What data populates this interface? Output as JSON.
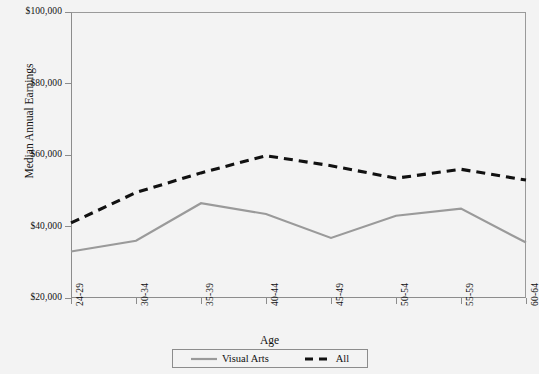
{
  "chart_data": {
    "type": "line",
    "title": "",
    "xlabel": "Age",
    "ylabel": "Median Annual Earnings",
    "categories": [
      "24-29",
      "30-34",
      "35-39",
      "40-44",
      "45-49",
      "50-54",
      "55-59",
      "60-64"
    ],
    "ylim": [
      20000,
      100000
    ],
    "yticks": [
      20000,
      40000,
      60000,
      80000,
      100000
    ],
    "ytick_labels": [
      "$20,000",
      "$40,000",
      "$60,000",
      "$80,000",
      "$100,000"
    ],
    "grid": false,
    "legend_position": "bottom",
    "series": [
      {
        "name": "Visual Arts",
        "color": "#9a9a9a",
        "style": "solid",
        "values": [
          33000,
          36000,
          46500,
          43500,
          36800,
          43000,
          45000,
          35500
        ]
      },
      {
        "name": "All",
        "color": "#111111",
        "style": "dashed",
        "values": [
          41000,
          49500,
          55000,
          59800,
          57000,
          53500,
          56000,
          53000
        ]
      }
    ]
  },
  "legend": {
    "entries": [
      {
        "label": "Visual Arts"
      },
      {
        "label": "All"
      }
    ]
  }
}
